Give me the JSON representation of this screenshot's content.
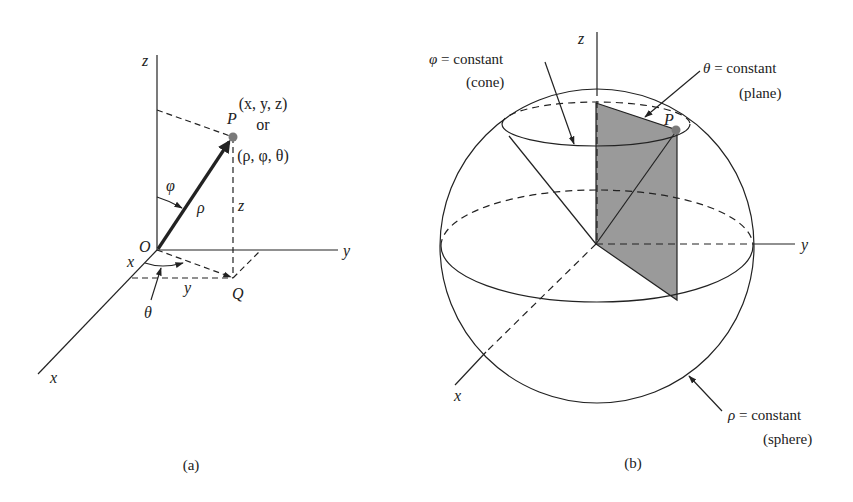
{
  "figure_a": {
    "caption": "(a)",
    "axes": {
      "z": "z",
      "y": "y",
      "x": "x"
    },
    "origin": "O",
    "point": "P",
    "projection": "Q",
    "coords_cartesian": "(x, y, z)",
    "or": "or",
    "coords_spherical": "(ρ, φ, θ)",
    "rho": "ρ",
    "phi": "φ",
    "theta": "θ",
    "z_len": "z",
    "x_len": "x",
    "y_len": "y"
  },
  "figure_b": {
    "caption": "(b)",
    "axes": {
      "z": "z",
      "y": "y",
      "x": "x"
    },
    "point": "P",
    "cone_label": {
      "symbol": "φ",
      "text": " = constant",
      "sub": "(cone)"
    },
    "plane_label": {
      "symbol": "θ",
      "text": " = constant",
      "sub": "(plane)"
    },
    "sphere_label": {
      "symbol": "ρ",
      "text": " = constant",
      "sub": "(sphere)"
    }
  },
  "colors": {
    "line": "#222222",
    "shade": "#9a9a9a",
    "point": "#7a7a7a"
  }
}
